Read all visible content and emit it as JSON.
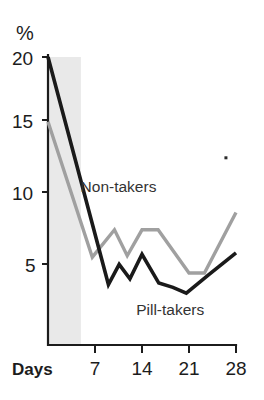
{
  "chart_data": {
    "type": "line",
    "title": "",
    "xlabel": "Days",
    "ylabel": "%",
    "ylim": [
      0,
      20
    ],
    "xlim": [
      0,
      28
    ],
    "grid": false,
    "legend": "inline-labels",
    "y_ticks": [
      5,
      10,
      15,
      20
    ],
    "y_tick_labels": [
      "5",
      "10",
      "15",
      "20"
    ],
    "x_ticks": [
      7,
      14,
      21,
      28
    ],
    "x_tick_labels": [
      "7",
      "14",
      "21",
      "28"
    ],
    "shaded_band": {
      "label": "",
      "x_start": 0,
      "x_end": 4.9,
      "color": "#e9e9e9"
    },
    "annotations": [
      {
        "text": "Non-takers",
        "x": 10.5,
        "y": 10.6
      },
      {
        "text": "Pill-takers",
        "x": 18.2,
        "y": 2.1
      }
    ],
    "series": [
      {
        "name": "Pill-takers",
        "color": "#1a1a1a",
        "points": [
          {
            "x": 0,
            "y": 20.0
          },
          {
            "x": 9.0,
            "y": 4.2
          },
          {
            "x": 10.6,
            "y": 5.6
          },
          {
            "x": 12.2,
            "y": 4.6
          },
          {
            "x": 14.0,
            "y": 6.3
          },
          {
            "x": 16.5,
            "y": 4.3
          },
          {
            "x": 18.6,
            "y": 4.0
          },
          {
            "x": 20.6,
            "y": 3.6
          },
          {
            "x": 24.0,
            "y": 4.9
          },
          {
            "x": 28.0,
            "y": 6.4
          }
        ]
      },
      {
        "name": "Non-takers",
        "color": "#a0a0a0",
        "points": [
          {
            "x": 0,
            "y": 15.5
          },
          {
            "x": 6.6,
            "y": 6.1
          },
          {
            "x": 9.9,
            "y": 8.0
          },
          {
            "x": 11.8,
            "y": 6.2
          },
          {
            "x": 14.0,
            "y": 8.0
          },
          {
            "x": 16.4,
            "y": 8.0
          },
          {
            "x": 21.0,
            "y": 5.0
          },
          {
            "x": 23.3,
            "y": 5.0
          },
          {
            "x": 28.0,
            "y": 9.2
          }
        ]
      }
    ],
    "stray_mark": {
      "x": 26.5,
      "y": 13.0
    }
  },
  "axis": {
    "unit_label": "%",
    "days_label": "Days"
  }
}
